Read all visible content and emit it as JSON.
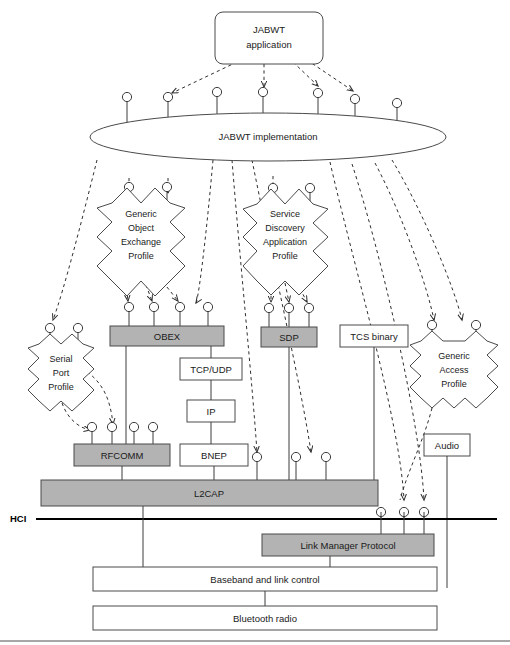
{
  "diagram": {
    "colors": {
      "gray_fill": "#b3b3b3",
      "white_fill": "#ffffff",
      "stroke": "#4a4a4a",
      "hci_line": "#000000"
    }
  },
  "nodes": {
    "application": {
      "label": "JABWT\napplication",
      "line1": "JABWT",
      "line2": "application",
      "shape": "rounded-rect"
    },
    "implementation": {
      "label": "JABWT implementation",
      "shape": "ellipse"
    },
    "goep": {
      "line1": "Generic",
      "line2": "Object",
      "line3": "Exchange",
      "line4": "Profile",
      "shape": "starburst"
    },
    "sdap": {
      "line1": "Service",
      "line2": "Discovery",
      "line3": "Application",
      "line4": "Profile",
      "shape": "starburst"
    },
    "spp": {
      "line1": "Serial",
      "line2": "Port",
      "line3": "Profile",
      "shape": "starburst"
    },
    "gap": {
      "line1": "Generic",
      "line2": "Access",
      "line3": "Profile",
      "shape": "starburst"
    },
    "obex": {
      "label": "OBEX",
      "shape": "rect",
      "fill": "gray"
    },
    "sdp": {
      "label": "SDP",
      "shape": "rect",
      "fill": "gray"
    },
    "tcs": {
      "label": "TCS binary",
      "shape": "rect",
      "fill": "white"
    },
    "tcpudp": {
      "label": "TCP/UDP",
      "shape": "rect",
      "fill": "white"
    },
    "ip": {
      "label": "IP",
      "shape": "rect",
      "fill": "white"
    },
    "bnep": {
      "label": "BNEP",
      "shape": "rect",
      "fill": "white"
    },
    "rfcomm": {
      "label": "RFCOMM",
      "shape": "rect",
      "fill": "gray"
    },
    "audio": {
      "label": "Audio",
      "shape": "rect",
      "fill": "white"
    },
    "l2cap": {
      "label": "L2CAP",
      "shape": "rect",
      "fill": "gray"
    },
    "lmp": {
      "label": "Link Manager Protocol",
      "shape": "rect",
      "fill": "gray"
    },
    "baseband": {
      "label": "Baseband and link control",
      "shape": "rect",
      "fill": "white"
    },
    "radio": {
      "label": "Bluetooth radio",
      "shape": "rect",
      "fill": "white"
    }
  },
  "annotations": {
    "hci": "HCI"
  },
  "interfaces": {
    "above_implementation_count": 7,
    "above_obex_count": 4,
    "above_sdp_count": 3,
    "above_rfcomm_count": 4,
    "above_l2cap_count": 3,
    "above_hci_count": 3,
    "above_goep_count": 2,
    "above_sdap_count": 2,
    "above_spp_count": 2,
    "above_gap_count": 2
  }
}
